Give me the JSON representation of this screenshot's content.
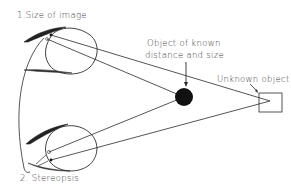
{
  "diagram": {
    "labels": {
      "size_of_image": "1.Size of image",
      "stereopsis": "2. Stereopsis",
      "known_object_line1": "Object of known",
      "known_object_line2": "distance and size",
      "unknown_object": "Unknown object"
    },
    "elements": {
      "top_eye": "eye with eyelids (upper)",
      "bottom_eye": "eye with eyelids (lower)",
      "known_object": "filled black circle",
      "unknown_object": "outlined square"
    },
    "colors": {
      "stroke": "#2a2a2a",
      "fill_known_object": "#111111",
      "background": "#ffffff"
    }
  }
}
